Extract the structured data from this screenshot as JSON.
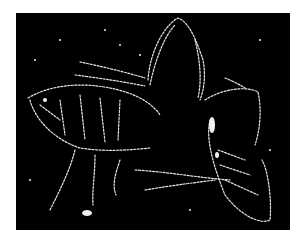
{
  "image": {
    "subject": "edge-detected micrograph of an insect (flea) on black background",
    "background_color": "#000000",
    "edge_color": "#e8e8e8",
    "page_background": "#ffffff"
  }
}
